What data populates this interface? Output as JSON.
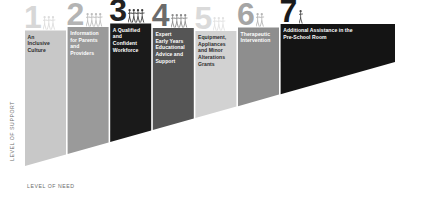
{
  "chart_data": {
    "type": "bar",
    "xlabel": "LEVEL OF NEED",
    "ylabel": "LEVEL OF SUPPORT",
    "grid": false,
    "legend": "none",
    "categories": [
      "1",
      "2",
      "3",
      "4",
      "5",
      "6",
      "7"
    ],
    "values": [
      1,
      2,
      3,
      4,
      5,
      6,
      7
    ],
    "labels": [
      "An Inclusive Culture",
      "Information for Parents and Providers",
      "A Qualified and Confident Workforce",
      "Expert Early Years Educational Advice and Support",
      "Equipment, Appliances and Minor Alterations Grants",
      "Therapeutic Intervention",
      "Additional Assistance in the Pre-School Room"
    ]
  },
  "axes": {
    "y_label": "LEVEL OF SUPPORT",
    "x_label": "LEVEL OF NEED"
  },
  "colors": {
    "step1": "#c8c8c8",
    "step2": "#9a9a9a",
    "step3": "#1a1a1a",
    "step4": "#555555",
    "step5": "#d2d2d2",
    "step6": "#8e8e8e",
    "step7": "#141414",
    "axis_text": "#6d6d6d",
    "page_background": "#ffffff"
  },
  "steps": [
    {
      "number": "1",
      "label": "An Inclusive Culture",
      "lines": [
        "An",
        "Inclusive",
        "Culture"
      ],
      "fill": "#c8c8c8",
      "number_color": "#d7d7d7",
      "text_color": "#2b2b2b",
      "figure_color": "#dcdcdc",
      "figure_count": 3
    },
    {
      "number": "2",
      "label": "Information for Parents and Providers",
      "lines": [
        "Information",
        "for Parents",
        "and",
        "Providers"
      ],
      "fill": "#9a9a9a",
      "number_color": "#b4b4b4",
      "text_color": "#ffffff",
      "figure_color": "#bdbdbd",
      "figure_count": 4
    },
    {
      "number": "3",
      "label": "A Qualified and Confident Workforce",
      "lines": [
        "A Qualified",
        "and",
        "Confident",
        "Workforce"
      ],
      "fill": "#1a1a1a",
      "number_color": "#222222",
      "text_color": "#ffffff",
      "figure_color": "#3a3a3a",
      "figure_count": 4
    },
    {
      "number": "4",
      "label": "Expert Early Years Educational Advice and Support",
      "lines": [
        "Expert",
        "Early Years",
        "Educational",
        "Advice and",
        "Support"
      ],
      "fill": "#555555",
      "number_color": "#6b6b6b",
      "text_color": "#ffffff",
      "figure_color": "#8a8a8a",
      "figure_count": 4
    },
    {
      "number": "5",
      "label": "Equipment, Appliances and Minor Alterations Grants",
      "lines": [
        "Equipment,",
        "Appliances",
        "and Minor",
        "Alterations",
        "Grants"
      ],
      "fill": "#d2d2d2",
      "number_color": "#dadada",
      "text_color": "#2b2b2b",
      "figure_color": "#e2e2e2",
      "figure_count": 3
    },
    {
      "number": "6",
      "label": "Therapeutic Intervention",
      "lines": [
        "Therapeutic",
        "Intervention"
      ],
      "fill": "#8e8e8e",
      "number_color": "#a5a5a5",
      "text_color": "#ffffff",
      "figure_color": "#b5b5b5",
      "figure_count": 2
    },
    {
      "number": "7",
      "label": "Additional Assistance in the Pre-School Room",
      "lines": [
        "Additional Assistance in the",
        "Pre-School Room"
      ],
      "fill": "#141414",
      "number_color": "#1a1a1a",
      "text_color": "#ffffff",
      "figure_color": "#4a4a4a",
      "figure_count": 1
    }
  ]
}
